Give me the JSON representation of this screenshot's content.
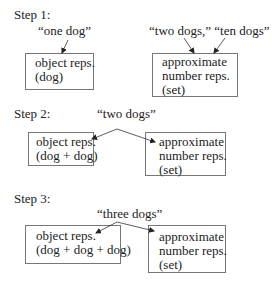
{
  "diagram": {
    "steps": [
      {
        "label": "Step 1:",
        "quotes": {
          "object": "“one dog”",
          "approximate": "“two dogs,” “ten dogs”"
        },
        "object_box": {
          "line1": "object reps.",
          "line2": "(dog)"
        },
        "approx_box": {
          "line1": "approximate",
          "line2": "number reps.",
          "line3": "(set)"
        }
      },
      {
        "label": "Step 2:",
        "quote": "“two dogs”",
        "object_box": {
          "line1": "object reps.",
          "line2": "(dog + dog)"
        },
        "approx_box": {
          "line1": "approximate",
          "line2": "number reps.",
          "line3": "(set)"
        }
      },
      {
        "label": "Step 3:",
        "quote": "“three dogs”",
        "object_box": {
          "line1": "object reps.",
          "line2": "(dog + dog + dog)"
        },
        "approx_box": {
          "line1": "approximate",
          "line2": "number reps.",
          "line3": "(set)"
        }
      }
    ],
    "colors": {
      "line": "#333333",
      "box_border": "#777777",
      "text": "#222222"
    }
  }
}
